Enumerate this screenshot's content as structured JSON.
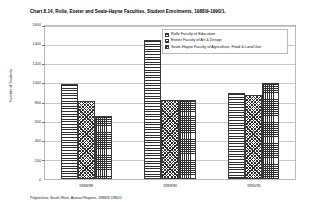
{
  "chart_data": {
    "type": "bar",
    "title": "Chart 8.14, Rolle, Exeter and Seale-Hayne Faculties, Student Enrolments, 1988/9-1990/1.",
    "xlabel": "",
    "ylabel": "Number of Students",
    "categories": [
      "1988/89",
      "1989/90",
      "1990/91"
    ],
    "series": [
      {
        "name": "Rolle Faculty of Education",
        "pattern": "horizontal-lines",
        "values": [
          990,
          1450,
          900
        ]
      },
      {
        "name": "Exeter Faculty of Art & Design",
        "pattern": "diagonal-crosshatch",
        "values": [
          820,
          830,
          880
        ]
      },
      {
        "name": "Seale-Hayne Faculty of Agriculture, Food & Land Use",
        "pattern": "fine-grid",
        "values": [
          660,
          830,
          1000
        ]
      }
    ],
    "ylim": [
      0,
      1600
    ],
    "ytick_step": 200,
    "yticks": [
      1600,
      1400,
      1200,
      1000,
      800,
      600,
      400,
      200,
      0
    ],
    "ytick_labels": [
      "1600",
      "1400",
      "1200",
      "1000",
      "800",
      "600",
      "400",
      "200",
      "0"
    ],
    "grid": true,
    "legend_position": "top-right",
    "source_note": "Polytechnic South West, Annual Reports, 1988/9-1990/1"
  }
}
